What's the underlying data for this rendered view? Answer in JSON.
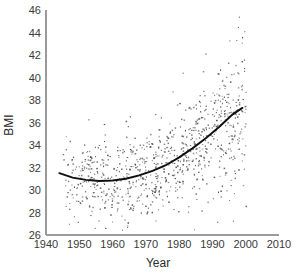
{
  "figure": {
    "background_color": "#ffffff",
    "axis_color": "#9a9a9a",
    "point_color": "#4d4d4d",
    "trend_color": "#101010"
  },
  "chart_data": {
    "type": "scatter",
    "title": "",
    "subtitle": "",
    "xlabel": "Year",
    "ylabel": "BMI",
    "xlim": [
      1940,
      2010
    ],
    "ylim": [
      26,
      46
    ],
    "xticks": [
      1940,
      1950,
      1960,
      1970,
      1980,
      1990,
      2000,
      2010
    ],
    "xtick_labels": [
      "1940",
      "1950",
      "1960",
      "1970",
      "1980",
      "1990",
      "2000",
      "2010"
    ],
    "yticks": [
      26,
      28,
      30,
      32,
      34,
      36,
      38,
      40,
      42,
      44,
      46
    ],
    "ytick_labels": [
      "26",
      "28",
      "30",
      "32",
      "34",
      "36",
      "38",
      "40",
      "42",
      "44",
      "46"
    ],
    "grid": false,
    "legend": null,
    "legend_position": "none",
    "annotations": [],
    "series": [
      {
        "name": "BMI observations",
        "type": "scatter",
        "marker": "point",
        "color": "#4d4d4d",
        "n_points": 900,
        "x_range": [
          1945,
          2000
        ],
        "y_range": [
          26.5,
          45.8
        ],
        "description": "Individual BMI measurements by year; spread widens and mean rises after 1975."
      },
      {
        "name": "Fitted quadratic trend",
        "type": "line",
        "color": "#101010",
        "x": [
          1944,
          1948,
          1952,
          1956,
          1960,
          1964,
          1968,
          1972,
          1976,
          1980,
          1984,
          1988,
          1992,
          1996,
          1999
        ],
        "y": [
          31.5,
          31.1,
          30.9,
          30.8,
          30.85,
          31.0,
          31.3,
          31.7,
          32.2,
          32.9,
          33.7,
          34.6,
          35.6,
          36.7,
          37.3
        ],
        "description": "Quadratic fit with minimum near 1957 at BMI 30.8, rising to 37.3 by 1999."
      }
    ],
    "scatter_density_by_decade": [
      {
        "decade": "1945-1949",
        "count": 40,
        "mean_bmi": 31.0,
        "sd": 1.9
      },
      {
        "decade": "1950-1959",
        "count": 150,
        "mean_bmi": 30.9,
        "sd": 2.0
      },
      {
        "decade": "1960-1969",
        "count": 150,
        "mean_bmi": 31.1,
        "sd": 2.0
      },
      {
        "decade": "1970-1979",
        "count": 160,
        "mean_bmi": 31.9,
        "sd": 2.2
      },
      {
        "decade": "1980-1989",
        "count": 180,
        "mean_bmi": 33.6,
        "sd": 2.6
      },
      {
        "decade": "1990-2000",
        "count": 220,
        "mean_bmi": 36.3,
        "sd": 3.2
      }
    ]
  }
}
